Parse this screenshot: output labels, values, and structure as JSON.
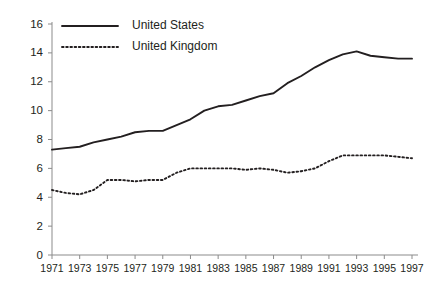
{
  "chart_data": {
    "type": "line",
    "title": "",
    "xlabel": "",
    "ylabel": "",
    "ylim": [
      0,
      16
    ],
    "xlim": [
      1971,
      1997
    ],
    "grid": false,
    "legend_position": "top-left",
    "y_ticks": [
      "0",
      "2",
      "4",
      "6",
      "8",
      "10",
      "12",
      "14",
      "16"
    ],
    "x_ticks": [
      "1971",
      "1973",
      "1975",
      "1977",
      "1979",
      "1981",
      "1983",
      "1985",
      "1987",
      "1989",
      "1991",
      "1993",
      "1995",
      "1997"
    ],
    "x": [
      1971,
      1972,
      1973,
      1974,
      1975,
      1976,
      1977,
      1978,
      1979,
      1980,
      1981,
      1982,
      1983,
      1984,
      1985,
      1986,
      1987,
      1988,
      1989,
      1990,
      1991,
      1992,
      1993,
      1994,
      1995,
      1996,
      1997
    ],
    "series": [
      {
        "name": "United States",
        "style": "solid",
        "color": "#231f20",
        "values": [
          7.3,
          7.4,
          7.5,
          7.8,
          8.0,
          8.2,
          8.5,
          8.6,
          8.6,
          9.0,
          9.4,
          10.0,
          10.3,
          10.4,
          10.7,
          11.0,
          11.2,
          11.9,
          12.4,
          13.0,
          13.5,
          13.9,
          14.1,
          13.8,
          13.7,
          13.6,
          13.6
        ]
      },
      {
        "name": "United Kingdom",
        "style": "dotted",
        "color": "#231f20",
        "values": [
          4.5,
          4.3,
          4.2,
          4.5,
          5.2,
          5.2,
          5.1,
          5.2,
          5.2,
          5.7,
          6.0,
          6.0,
          6.0,
          6.0,
          5.9,
          6.0,
          5.9,
          5.7,
          5.8,
          6.0,
          6.5,
          6.9,
          6.9,
          6.9,
          6.9,
          6.8,
          6.7
        ]
      }
    ]
  },
  "legend": {
    "items": [
      {
        "label": "United States",
        "style": "solid"
      },
      {
        "label": "United Kingdom",
        "style": "dotted"
      }
    ]
  }
}
